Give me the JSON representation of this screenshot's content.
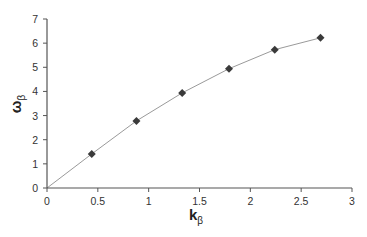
{
  "chart_data": {
    "type": "line",
    "title": "",
    "xlabel": "k",
    "xlabel_sub": "β",
    "ylabel": "ω",
    "ylabel_sub": "β",
    "xlim": [
      0,
      3
    ],
    "ylim": [
      0,
      7
    ],
    "x_ticks": [
      "0",
      "0.5",
      "1",
      "1.5",
      "2",
      "2.5",
      "3"
    ],
    "y_ticks": [
      "0",
      "1",
      "2",
      "3",
      "4",
      "5",
      "6",
      "7"
    ],
    "grid": false,
    "legend": null,
    "series": [
      {
        "name": "data",
        "marker": "diamond",
        "x": [
          0.44,
          0.88,
          1.33,
          1.79,
          2.24,
          2.69
        ],
        "y": [
          1.41,
          2.78,
          3.94,
          4.94,
          5.73,
          6.22
        ]
      },
      {
        "name": "fit",
        "marker": "none",
        "x": [
          0,
          0.44,
          0.88,
          1.33,
          1.79,
          2.24,
          2.69
        ],
        "y": [
          0,
          1.41,
          2.78,
          3.94,
          4.94,
          5.73,
          6.22
        ]
      }
    ],
    "colors": {
      "marker": "#3a3a3a",
      "line": "#9a9a9a",
      "axis": "#555555"
    }
  }
}
